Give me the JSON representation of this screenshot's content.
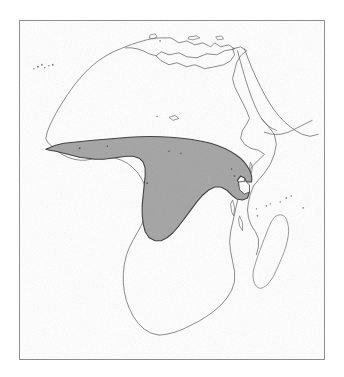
{
  "figure": {
    "type": "distribution-range-map",
    "region": "Africa",
    "title": "",
    "caption": "",
    "labels": [],
    "background_color": "#ffffff",
    "frame": {
      "visible": true,
      "color": "#8d8d8d",
      "line_width_px": 1,
      "x": 19,
      "y": 20,
      "width": 306,
      "height": 340
    }
  },
  "legend": {
    "visible": false,
    "entries": [
      {
        "label": "",
        "swatch_color": "#a3a3a3",
        "description": "shaded distribution range"
      }
    ]
  },
  "map_data": {
    "projection_note": "",
    "landmass_outline_color": "#5d5d5d",
    "range_fill_color": "#a3a3a3",
    "range_outline_color": "#3a3a3a",
    "lake_fill_color": "#ffffff",
    "features": [
      {
        "name": "africa-mainland",
        "kind": "coastline",
        "shaded": false
      },
      {
        "name": "madagascar",
        "kind": "island",
        "shaded": false
      },
      {
        "name": "arabian-peninsula-edge",
        "kind": "coastline",
        "shaded": false
      },
      {
        "name": "mediterranean-islands",
        "kind": "island-group",
        "shaded": false
      },
      {
        "name": "canary-islands",
        "kind": "island-group",
        "shaded": false
      },
      {
        "name": "comoros-mascarene-islets",
        "kind": "island-group",
        "shaded": false
      },
      {
        "name": "distribution-range",
        "kind": "range-polygon",
        "shaded": true
      },
      {
        "name": "lake-victoria",
        "kind": "lake",
        "shaded": false
      }
    ]
  },
  "chart_data": {
    "type": "map",
    "title": "",
    "xlabel": "",
    "ylabel": "",
    "series": [
      {
        "name": "distribution-range",
        "fill": "#a3a3a3",
        "coverage_description": "Continuous belt across West Africa from Senegal/Guinea coast eastwards through the Gulf of Guinea countries and the Congo Basin to the Albertine Rift and Lake Victoria",
        "northern_limit_approx_lat_deg": 14,
        "southern_limit_approx_lat_deg": -6,
        "western_limit_approx_lon_deg": -17,
        "eastern_limit_approx_lon_deg": 35
      }
    ],
    "annotations": []
  }
}
